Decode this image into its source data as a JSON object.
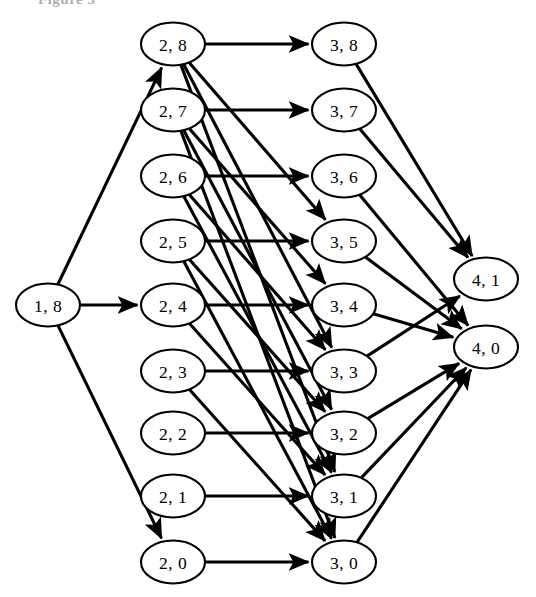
{
  "figure": {
    "caption": "Figure 5",
    "background_color": "#ffffff",
    "stroke_color": "#000000",
    "node_fill": "#ffffff"
  },
  "graph": {
    "type": "directed-layered-graph",
    "node_rx": 32,
    "node_ry": 21.5,
    "layers": [
      {
        "name": "layer-1",
        "x": 48,
        "nodes": [
          {
            "id": "n1_8",
            "label": "1, 8",
            "x": 48,
            "y": 305
          }
        ]
      },
      {
        "name": "layer-2",
        "x": 173,
        "nodes": [
          {
            "id": "n2_8",
            "label": "2, 8",
            "x": 173,
            "y": 44
          },
          {
            "id": "n2_7",
            "label": "2, 7",
            "x": 173,
            "y": 110
          },
          {
            "id": "n2_6",
            "label": "2, 6",
            "x": 173,
            "y": 176
          },
          {
            "id": "n2_5",
            "label": "2, 5",
            "x": 173,
            "y": 241
          },
          {
            "id": "n2_4",
            "label": "2, 4",
            "x": 173,
            "y": 305
          },
          {
            "id": "n2_3",
            "label": "2, 3",
            "x": 173,
            "y": 371
          },
          {
            "id": "n2_2",
            "label": "2, 2",
            "x": 173,
            "y": 433
          },
          {
            "id": "n2_1",
            "label": "2, 1",
            "x": 173,
            "y": 496
          },
          {
            "id": "n2_0",
            "label": "2, 0",
            "x": 173,
            "y": 562
          }
        ]
      },
      {
        "name": "layer-3",
        "x": 344,
        "nodes": [
          {
            "id": "n3_8",
            "label": "3, 8",
            "x": 344,
            "y": 44
          },
          {
            "id": "n3_7",
            "label": "3, 7",
            "x": 344,
            "y": 110
          },
          {
            "id": "n3_6",
            "label": "3, 6",
            "x": 344,
            "y": 176
          },
          {
            "id": "n3_5",
            "label": "3, 5",
            "x": 344,
            "y": 241
          },
          {
            "id": "n3_4",
            "label": "3, 4",
            "x": 344,
            "y": 305
          },
          {
            "id": "n3_3",
            "label": "3, 3",
            "x": 344,
            "y": 371
          },
          {
            "id": "n3_2",
            "label": "3, 2",
            "x": 344,
            "y": 433
          },
          {
            "id": "n3_1",
            "label": "3, 1",
            "x": 344,
            "y": 496
          },
          {
            "id": "n3_0",
            "label": "3, 0",
            "x": 344,
            "y": 562
          }
        ]
      },
      {
        "name": "layer-4",
        "x": 486,
        "nodes": [
          {
            "id": "n4_1",
            "label": "4, 1",
            "x": 486,
            "y": 279
          },
          {
            "id": "n4_0",
            "label": "4, 0",
            "x": 486,
            "y": 347
          }
        ]
      }
    ],
    "edges": [
      {
        "from": "n1_8",
        "to": "n2_8",
        "arrow": true
      },
      {
        "from": "n1_8",
        "to": "n2_4",
        "arrow": true
      },
      {
        "from": "n1_8",
        "to": "n2_0",
        "arrow": true
      },
      {
        "from": "n2_8",
        "to": "n3_8",
        "arrow": true
      },
      {
        "from": "n2_8",
        "to": "n3_5",
        "arrow": true
      },
      {
        "from": "n2_8",
        "to": "n3_3",
        "arrow": true
      },
      {
        "from": "n2_8",
        "to": "n3_1",
        "arrow": true
      },
      {
        "from": "n2_7",
        "to": "n3_7",
        "arrow": true
      },
      {
        "from": "n2_7",
        "to": "n3_4",
        "arrow": true
      },
      {
        "from": "n2_7",
        "to": "n3_2",
        "arrow": true
      },
      {
        "from": "n2_7",
        "to": "n3_0",
        "arrow": true
      },
      {
        "from": "n2_6",
        "to": "n3_6",
        "arrow": true
      },
      {
        "from": "n2_6",
        "to": "n3_3",
        "arrow": true
      },
      {
        "from": "n2_6",
        "to": "n3_1",
        "arrow": true
      },
      {
        "from": "n2_5",
        "to": "n3_5",
        "arrow": true
      },
      {
        "from": "n2_5",
        "to": "n3_2",
        "arrow": true
      },
      {
        "from": "n2_5",
        "to": "n3_0",
        "arrow": true
      },
      {
        "from": "n2_4",
        "to": "n3_4",
        "arrow": true
      },
      {
        "from": "n2_4",
        "to": "n3_1",
        "arrow": true
      },
      {
        "from": "n2_3",
        "to": "n3_3",
        "arrow": true
      },
      {
        "from": "n2_3",
        "to": "n3_0",
        "arrow": true
      },
      {
        "from": "n2_2",
        "to": "n3_2",
        "arrow": true
      },
      {
        "from": "n2_1",
        "to": "n3_1",
        "arrow": true
      },
      {
        "from": "n2_0",
        "to": "n3_0",
        "arrow": true
      },
      {
        "from": "n3_8",
        "to": "n4_1",
        "arrow": true
      },
      {
        "from": "n3_7",
        "to": "n4_1",
        "arrow": true
      },
      {
        "from": "n3_6",
        "to": "n4_0",
        "arrow": true
      },
      {
        "from": "n3_5",
        "to": "n4_0",
        "arrow": true
      },
      {
        "from": "n3_4",
        "to": "n4_0",
        "arrow": true
      },
      {
        "from": "n3_3",
        "to": "n4_1",
        "arrow": true
      },
      {
        "from": "n3_2",
        "to": "n4_0",
        "arrow": true
      },
      {
        "from": "n3_1",
        "to": "n4_0",
        "arrow": true
      },
      {
        "from": "n3_0",
        "to": "n4_0",
        "arrow": true
      }
    ]
  }
}
